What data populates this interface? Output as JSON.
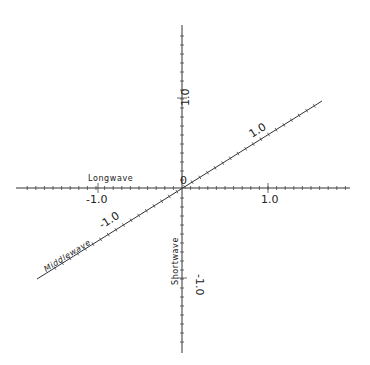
{
  "diagram": {
    "type": "three-axis cone-response diagram",
    "origin_label": "0",
    "axes": [
      {
        "name": "Longwave",
        "orientation": "horizontal",
        "tick_labels": [
          "-1.0",
          "1.0"
        ],
        "label": "Longwave"
      },
      {
        "name": "Shortwave",
        "orientation": "vertical",
        "tick_labels": [
          "1.0",
          "-1.0"
        ],
        "label": "Shortwave"
      },
      {
        "name": "Middlewave",
        "orientation": "diagonal",
        "tick_labels": [
          "1.0",
          "-1.0"
        ],
        "label": "Middlewave"
      }
    ],
    "colors": {
      "line": "#333333",
      "background": "#ffffff"
    }
  },
  "labels": {
    "origin": "0",
    "longwave": "Longwave",
    "shortwave": "Shortwave",
    "middlewave": "Middlewave",
    "h_pos": "1.0",
    "h_neg": "-1.0",
    "v_pos": "1.0",
    "v_neg": "-1.0",
    "d_pos": "1.0",
    "d_neg": "-1.0"
  }
}
